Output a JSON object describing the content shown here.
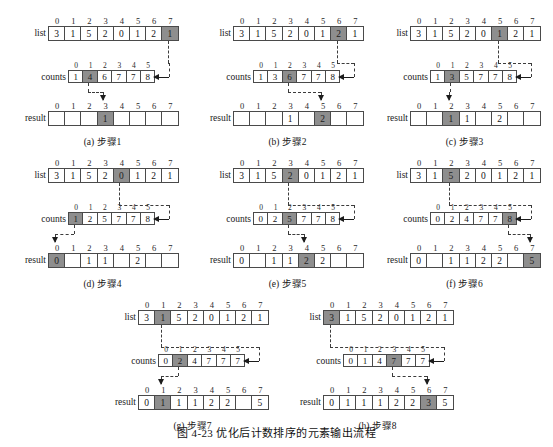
{
  "figure": {
    "caption": "图 4-23   优化后计数排序的元素输出流程",
    "labels": {
      "list": "list",
      "counts": "counts",
      "result": "result"
    },
    "list_indices": [
      "0",
      "1",
      "2",
      "3",
      "4",
      "5",
      "6",
      "7"
    ],
    "counts_indices": [
      "0",
      "1",
      "2",
      "3",
      "4",
      "5"
    ],
    "result_indices": [
      "0",
      "1",
      "2",
      "3",
      "4",
      "5",
      "6",
      "7"
    ],
    "highlight_color": "#8e8e8e",
    "panels": [
      {
        "id": "a",
        "subcaption": "(a) 步骤1",
        "list": {
          "values": [
            "3",
            "1",
            "5",
            "2",
            "0",
            "1",
            "2",
            "1"
          ],
          "highlight": 7
        },
        "counts": {
          "values": [
            "1",
            "4",
            "6",
            "7",
            "7",
            "8"
          ],
          "highlight": 1
        },
        "result": {
          "values": [
            "",
            "",
            "",
            "1",
            "",
            "",
            "",
            ""
          ],
          "highlight": 3
        }
      },
      {
        "id": "b",
        "subcaption": "(b) 步骤2",
        "list": {
          "values": [
            "3",
            "1",
            "5",
            "2",
            "0",
            "1",
            "2",
            "1"
          ],
          "highlight": 6
        },
        "counts": {
          "values": [
            "1",
            "3",
            "6",
            "7",
            "7",
            "8"
          ],
          "highlight": 2
        },
        "result": {
          "values": [
            "",
            "",
            "",
            "1",
            "",
            "2",
            "",
            ""
          ],
          "highlight": 5
        }
      },
      {
        "id": "c",
        "subcaption": "(c) 步骤3",
        "list": {
          "values": [
            "3",
            "1",
            "5",
            "2",
            "0",
            "1",
            "2",
            "1"
          ],
          "highlight": 5
        },
        "counts": {
          "values": [
            "1",
            "3",
            "5",
            "7",
            "7",
            "8"
          ],
          "highlight": 1
        },
        "result": {
          "values": [
            "",
            "",
            "1",
            "1",
            "",
            "2",
            "",
            ""
          ],
          "highlight": 2
        }
      },
      {
        "id": "d",
        "subcaption": "(d) 步骤4",
        "list": {
          "values": [
            "3",
            "1",
            "5",
            "2",
            "0",
            "1",
            "2",
            "1"
          ],
          "highlight": 4
        },
        "counts": {
          "values": [
            "1",
            "2",
            "5",
            "7",
            "7",
            "8"
          ],
          "highlight": 0
        },
        "result": {
          "values": [
            "0",
            "",
            "1",
            "1",
            "",
            "2",
            "",
            ""
          ],
          "highlight": 0
        }
      },
      {
        "id": "e",
        "subcaption": "(e) 步骤5",
        "list": {
          "values": [
            "3",
            "1",
            "5",
            "2",
            "0",
            "1",
            "2",
            "1"
          ],
          "highlight": 3
        },
        "counts": {
          "values": [
            "0",
            "2",
            "5",
            "7",
            "7",
            "8"
          ],
          "highlight": 2
        },
        "result": {
          "values": [
            "0",
            "",
            "1",
            "1",
            "2",
            "2",
            "",
            ""
          ],
          "highlight": 4
        }
      },
      {
        "id": "f",
        "subcaption": "(f) 步骤6",
        "list": {
          "values": [
            "3",
            "1",
            "5",
            "2",
            "0",
            "1",
            "2",
            "1"
          ],
          "highlight": 2
        },
        "counts": {
          "values": [
            "0",
            "2",
            "4",
            "7",
            "7",
            "8"
          ],
          "highlight": 5
        },
        "result": {
          "values": [
            "0",
            "",
            "1",
            "1",
            "2",
            "2",
            "",
            "5"
          ],
          "highlight": 7
        }
      },
      {
        "id": "g",
        "subcaption": "(g) 步骤7",
        "list": {
          "values": [
            "3",
            "1",
            "5",
            "2",
            "0",
            "1",
            "2",
            "1"
          ],
          "highlight": 1
        },
        "counts": {
          "values": [
            "0",
            "2",
            "4",
            "7",
            "7",
            "7"
          ],
          "highlight": 1
        },
        "result": {
          "values": [
            "0",
            "1",
            "1",
            "1",
            "2",
            "2",
            "",
            "5"
          ],
          "highlight": 1
        }
      },
      {
        "id": "h",
        "subcaption": "(h) 步骤8",
        "list": {
          "values": [
            "3",
            "1",
            "5",
            "2",
            "0",
            "1",
            "2",
            "1"
          ],
          "highlight": 0
        },
        "counts": {
          "values": [
            "0",
            "1",
            "4",
            "7",
            "7",
            "7"
          ],
          "highlight": 3
        },
        "result": {
          "values": [
            "0",
            "1",
            "1",
            "1",
            "2",
            "2",
            "3",
            "5"
          ],
          "highlight": 6
        }
      }
    ]
  }
}
